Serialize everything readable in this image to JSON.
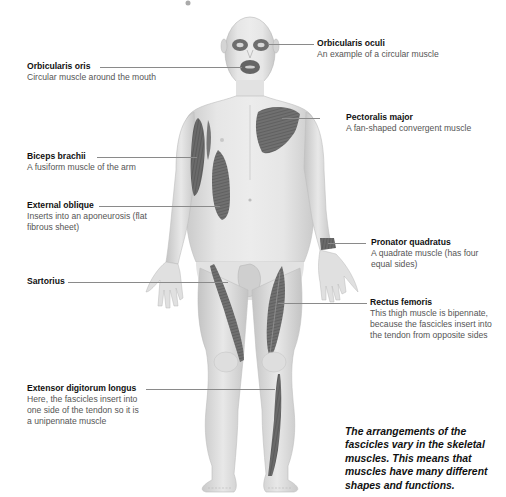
{
  "diagram": {
    "labels": [
      {
        "id": "orbicularis-oculi",
        "name": "Orbicularis oculi",
        "desc": "An example of a circular muscle"
      },
      {
        "id": "orbicularis-oris",
        "name": "Orbicularis oris",
        "desc": "Circular muscle around the mouth"
      },
      {
        "id": "pectoralis-major",
        "name": "Pectoralis major",
        "desc": "A fan-shaped convergent muscle"
      },
      {
        "id": "biceps-brachii",
        "name": "Biceps brachii",
        "desc": "A fusiform muscle of the arm"
      },
      {
        "id": "external-oblique",
        "name": "External oblique",
        "desc": "Inserts into an aponeurosis (flat fibrous sheet)"
      },
      {
        "id": "pronator-quadratus",
        "name": "Pronator quadratus",
        "desc": "A quadrate muscle (has four equal sides)"
      },
      {
        "id": "sartorius",
        "name": "Sartorius",
        "desc": ""
      },
      {
        "id": "rectus-femoris",
        "name": "Rectus femoris",
        "desc": "This thigh muscle is bipennate, because the fascicles insert into the tendon from opposite sides"
      },
      {
        "id": "extensor-digitorum-longus",
        "name": "Extensor digitorum longus",
        "desc": "Here, the fascicles insert into one side of the tendon so it is a unipennate muscle"
      }
    ],
    "caption": "The arrangements of the fascicles vary in the skeletal muscles. This means that muscles have many different shapes and functions.",
    "colors": {
      "skin": "#e4e4e4",
      "skin_shadow": "#c9c9c9",
      "muscle": "#6e6e6e",
      "muscle_dark": "#555555",
      "leader_line": "#8a8a8a",
      "text_name": "#111111",
      "text_desc": "#555555"
    }
  }
}
